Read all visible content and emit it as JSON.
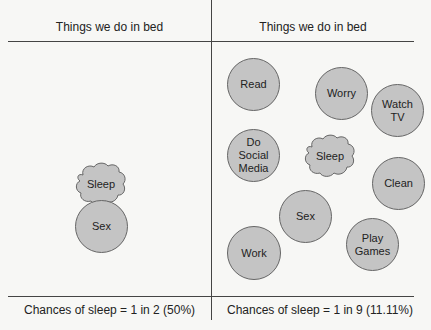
{
  "left_panel": {
    "title": "Things we do in bed",
    "items": {
      "sleep": "Sleep",
      "sex": "Sex"
    },
    "footer": "Chances of sleep = 1 in 2 (50%)"
  },
  "right_panel": {
    "title": "Things we do in bed",
    "items": {
      "read": "Read",
      "worry": "Worry",
      "watch_tv_1": "Watch",
      "watch_tv_2": "TV",
      "social_1": "Do",
      "social_2": "Social",
      "social_3": "Media",
      "sleep": "Sleep",
      "clean": "Clean",
      "sex": "Sex",
      "play_1": "Play",
      "play_2": "Games",
      "work": "Work"
    },
    "footer": "Chances of sleep = 1 in 9 (11.11%)"
  },
  "colors": {
    "circle_fill": "#c4c4c4",
    "stroke": "#666666",
    "line": "#444444",
    "background": "#f7f7f5"
  }
}
